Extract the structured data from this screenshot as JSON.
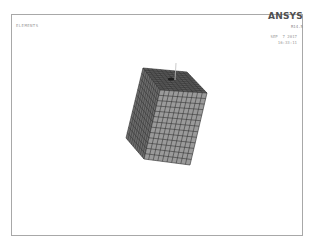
{
  "viewport": {
    "plot_label": "ELEMENTS",
    "brand": "ANSYS",
    "version": "R14.5",
    "date": "SEP  7 2017",
    "time": "16:33:11"
  },
  "model": {
    "type": "hexahedral mesh block",
    "mesh_divisions": {
      "front_cols": 10,
      "front_rows": 13,
      "side_cols": 10,
      "top_rows": 10
    },
    "colors": {
      "front_face": "#9a9a9a",
      "left_face": "#6e6e6e",
      "top_face": "#5a5a5a",
      "mesh_lines": "#2e2e2e",
      "frame_border": "#a8a8a8"
    }
  }
}
